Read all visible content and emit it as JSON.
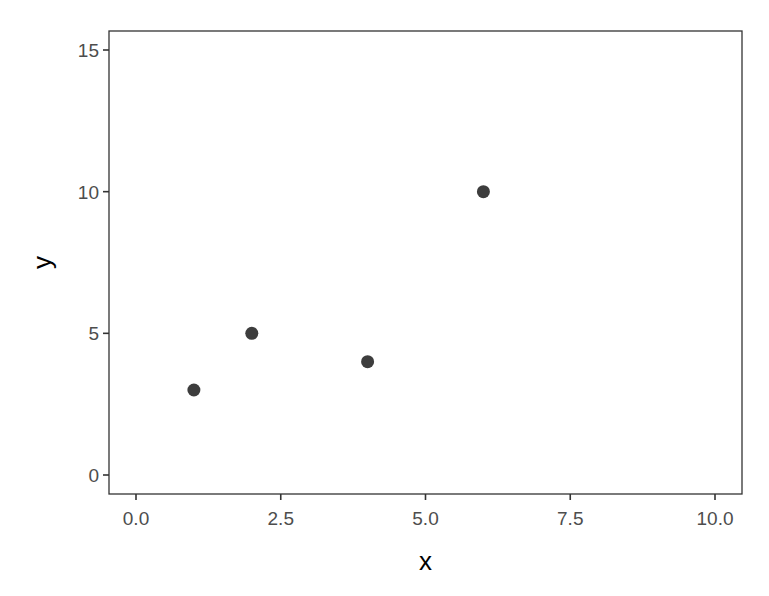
{
  "chart_data": {
    "type": "scatter",
    "title": "",
    "xlabel": "x",
    "ylabel": "y",
    "xlim": [
      -0.5,
      10.5
    ],
    "ylim": [
      -0.7,
      15.7
    ],
    "x_ticks": [
      0.0,
      2.5,
      5.0,
      7.5,
      10.0
    ],
    "x_tick_labels": [
      "0.0",
      "2.5",
      "5.0",
      "7.5",
      "10.0"
    ],
    "y_ticks": [
      0,
      5,
      10,
      15
    ],
    "y_tick_labels": [
      "0",
      "5",
      "10",
      "15"
    ],
    "grid": false,
    "legend": null,
    "series": [
      {
        "name": "points",
        "color": "#3d3d3d",
        "points": [
          {
            "x": 1,
            "y": 3
          },
          {
            "x": 2,
            "y": 5
          },
          {
            "x": 4,
            "y": 4
          },
          {
            "x": 6,
            "y": 10
          }
        ]
      }
    ]
  },
  "layout": {
    "panel": {
      "left": 109,
      "top": 31,
      "right": 742,
      "bottom": 494
    },
    "x_px": {
      "v0": 0,
      "p0": 136,
      "v1": 10,
      "p1": 715
    },
    "y_px": {
      "v0": 0,
      "p0": 475,
      "v1": 15,
      "p1": 50
    }
  }
}
